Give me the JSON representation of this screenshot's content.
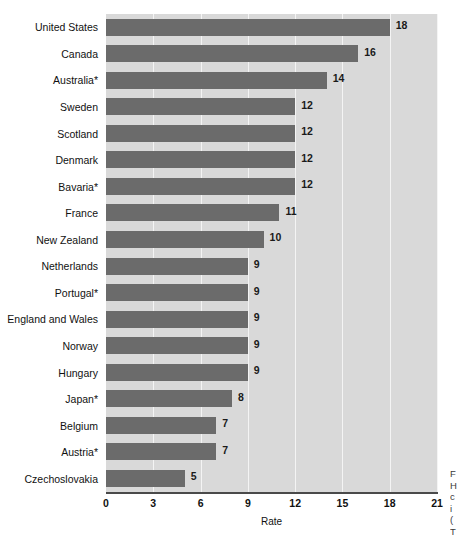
{
  "chart_data": {
    "type": "bar",
    "orientation": "horizontal",
    "title": "",
    "xlabel": "Rate",
    "ylabel": "",
    "xlim": [
      0,
      21
    ],
    "xticks": [
      0,
      3,
      6,
      9,
      12,
      15,
      18,
      21
    ],
    "grid": true,
    "legend": false,
    "categories": [
      "United States",
      "Canada",
      "Australia*",
      "Sweden",
      "Scotland",
      "Denmark",
      "Bavaria*",
      "France",
      "New Zealand",
      "Netherlands",
      "Portugal*",
      "England and Wales",
      "Norway",
      "Hungary",
      "Japan*",
      "Belgium",
      "Austria*",
      "Czechoslovakia"
    ],
    "values": [
      18,
      16,
      14,
      12,
      12,
      12,
      12,
      11,
      10,
      9,
      9,
      9,
      9,
      9,
      8,
      7,
      7,
      5
    ],
    "data_labels": [
      "18",
      "16",
      "14",
      "12",
      "12",
      "12",
      "12",
      "11",
      "10",
      "9",
      "9",
      "9",
      "9",
      "9",
      "8",
      "7",
      "7",
      "5"
    ],
    "bar_color": "#6b6b6b",
    "plot_background": "#d9d9d9",
    "gridline_color": "#f4f4f4",
    "axis_color": "#4a4a4a"
  },
  "side_caption": {
    "lines": [
      "F",
      "H",
      "c",
      "i",
      "(",
      "T"
    ]
  }
}
